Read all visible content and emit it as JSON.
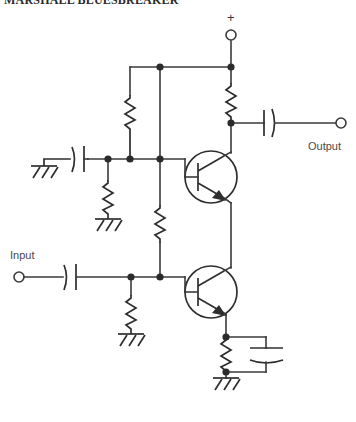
{
  "figure": {
    "title": "MARSHALL BLUESBREAKER",
    "type": "electronic-schematic",
    "background_color": "#ffffff",
    "line_color": "#3a3a3a"
  },
  "labels": {
    "input": "Input",
    "output": "Output",
    "supply": "+"
  },
  "terminals": [
    {
      "name": "supply-terminal",
      "label": "+",
      "x": 231,
      "y": 35,
      "r": 5
    },
    {
      "name": "output-terminal",
      "label": "Output",
      "x": 341,
      "y": 115,
      "r": 5
    },
    {
      "name": "input-terminal",
      "label": "Input",
      "x": 19,
      "y": 277,
      "r": 5
    }
  ],
  "components": {
    "transistors": [
      {
        "name": "transistor-q1",
        "type": "NPN",
        "cx": 211,
        "cy": 177,
        "r": 26
      },
      {
        "name": "transistor-q2",
        "type": "NPN",
        "cx": 211,
        "cy": 292,
        "r": 26
      }
    ],
    "resistors": [
      {
        "name": "resistor-collector-q1",
        "orientation": "vertical",
        "x": 231,
        "y1": 83,
        "y2": 117
      },
      {
        "name": "resistor-bias-upper",
        "orientation": "vertical",
        "x": 131,
        "y1": 95,
        "y2": 135
      },
      {
        "name": "resistor-base-q1-ground",
        "orientation": "vertical",
        "x": 108,
        "y1": 180,
        "y2": 215
      },
      {
        "name": "resistor-feedback-middle",
        "orientation": "vertical",
        "x": 160,
        "y1": 205,
        "y2": 243
      },
      {
        "name": "resistor-base-q2-ground",
        "orientation": "vertical",
        "x": 131,
        "y1": 295,
        "y2": 330
      },
      {
        "name": "resistor-emitter-q2",
        "orientation": "vertical",
        "x": 226,
        "y1": 337,
        "y2": 372
      }
    ],
    "capacitors": [
      {
        "name": "capacitor-output-coupling",
        "orientation": "horizontal",
        "type": "polarized",
        "x": 271,
        "y": 115
      },
      {
        "name": "capacitor-bias-decoupling",
        "orientation": "horizontal",
        "type": "polarized",
        "x": 78,
        "y": 159
      },
      {
        "name": "capacitor-input-coupling",
        "orientation": "horizontal",
        "type": "polarized",
        "x": 70,
        "y": 277
      },
      {
        "name": "capacitor-emitter-bypass",
        "orientation": "vertical",
        "type": "polarized",
        "x": 266,
        "y": 355
      }
    ],
    "grounds": [
      {
        "name": "ground-bias-decoupling",
        "x": 44,
        "y": 166
      },
      {
        "name": "ground-base-q1",
        "x": 108,
        "y": 219
      },
      {
        "name": "ground-base-q2",
        "x": 131,
        "y": 334
      },
      {
        "name": "ground-emitter-q2",
        "x": 226,
        "y": 376
      }
    ],
    "junctions": [
      {
        "name": "junction-top-rail-left",
        "x": 160,
        "y": 67
      },
      {
        "name": "junction-top-rail-supply",
        "x": 231,
        "y": 67
      },
      {
        "name": "junction-collector-q1",
        "x": 231,
        "y": 123
      },
      {
        "name": "junction-base-rail-left",
        "x": 108,
        "y": 159
      },
      {
        "name": "junction-base-rail-mid",
        "x": 131,
        "y": 159
      },
      {
        "name": "junction-base-rail-q1",
        "x": 160,
        "y": 159
      },
      {
        "name": "junction-base-q2-left",
        "x": 131,
        "y": 277
      },
      {
        "name": "junction-base-q2-mid",
        "x": 160,
        "y": 277
      },
      {
        "name": "junction-emitter-q2-top",
        "x": 226,
        "y": 337
      },
      {
        "name": "junction-emitter-q2-bottom",
        "x": 226,
        "y": 372
      }
    ]
  }
}
